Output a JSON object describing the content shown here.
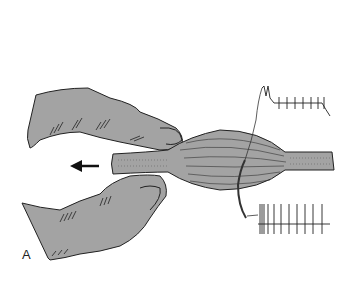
{
  "figure": {
    "panel_label": "A",
    "colors": {
      "background": "#ffffff",
      "tissue_fill": "#a3a3a3",
      "outline": "#222222"
    },
    "arrow": {
      "direction": "left"
    },
    "traces": [
      {
        "name": "upper-trace",
        "description": "initial burst followed by regular spikes and decay",
        "spike_count": 8
      },
      {
        "name": "lower-trace",
        "description": "dense initial burst followed by regular spikes",
        "spike_count": 11
      }
    ]
  }
}
